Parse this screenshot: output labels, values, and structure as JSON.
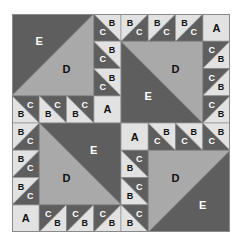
{
  "diagram": {
    "grid_units": 8,
    "colors": {
      "dark": "#5e5e5e",
      "medium": "#a9a9a9",
      "light": "#e2e2e2",
      "outline": "#8a8a8a",
      "label_on_dark": "#ffffff",
      "label_on_light": "#111111"
    },
    "piece_labels": {
      "A": "A",
      "B": "B",
      "C": "C",
      "D": "D",
      "E": "E"
    },
    "quadrants": [
      {
        "name": "top-left",
        "big_square": {
          "col": 0,
          "row": 0,
          "size": 3,
          "diagonal": "bl-tr",
          "dark_label": "E",
          "dark_side": "tl",
          "light_label": "D"
        },
        "square_a": {
          "col": 3,
          "row": 3,
          "label": "A"
        },
        "half_square_triangles": [
          {
            "col": 3,
            "row": 0,
            "diagonal": "tl-br",
            "dark_side": "bl"
          },
          {
            "col": 3,
            "row": 1,
            "diagonal": "tl-br",
            "dark_side": "bl"
          },
          {
            "col": 3,
            "row": 2,
            "diagonal": "tl-br",
            "dark_side": "bl"
          },
          {
            "col": 0,
            "row": 3,
            "diagonal": "tl-br",
            "dark_side": "tr"
          },
          {
            "col": 1,
            "row": 3,
            "diagonal": "tl-br",
            "dark_side": "tr"
          },
          {
            "col": 2,
            "row": 3,
            "diagonal": "tl-br",
            "dark_side": "tr"
          }
        ]
      },
      {
        "name": "top-right",
        "big_square": {
          "col": 4,
          "row": 1,
          "size": 3,
          "diagonal": "tl-br",
          "dark_label": "E",
          "dark_side": "bl",
          "light_label": "D"
        },
        "square_a": {
          "col": 7,
          "row": 0,
          "label": "A"
        },
        "half_square_triangles": [
          {
            "col": 4,
            "row": 0,
            "diagonal": "bl-tr",
            "dark_side": "br"
          },
          {
            "col": 5,
            "row": 0,
            "diagonal": "bl-tr",
            "dark_side": "br"
          },
          {
            "col": 6,
            "row": 0,
            "diagonal": "bl-tr",
            "dark_side": "br"
          },
          {
            "col": 7,
            "row": 1,
            "diagonal": "bl-tr",
            "dark_side": "tl"
          },
          {
            "col": 7,
            "row": 2,
            "diagonal": "bl-tr",
            "dark_side": "tl"
          },
          {
            "col": 7,
            "row": 3,
            "diagonal": "bl-tr",
            "dark_side": "tl"
          }
        ]
      },
      {
        "name": "bottom-left",
        "big_square": {
          "col": 1,
          "row": 4,
          "size": 3,
          "diagonal": "tl-br",
          "dark_label": "E",
          "dark_side": "tr",
          "light_label": "D"
        },
        "square_a": {
          "col": 0,
          "row": 7,
          "label": "A"
        },
        "half_square_triangles": [
          {
            "col": 0,
            "row": 4,
            "diagonal": "bl-tr",
            "dark_side": "br"
          },
          {
            "col": 0,
            "row": 5,
            "diagonal": "bl-tr",
            "dark_side": "br"
          },
          {
            "col": 0,
            "row": 6,
            "diagonal": "bl-tr",
            "dark_side": "br"
          },
          {
            "col": 1,
            "row": 7,
            "diagonal": "bl-tr",
            "dark_side": "tl"
          },
          {
            "col": 2,
            "row": 7,
            "diagonal": "bl-tr",
            "dark_side": "tl"
          },
          {
            "col": 3,
            "row": 7,
            "diagonal": "bl-tr",
            "dark_side": "tl"
          }
        ]
      },
      {
        "name": "bottom-right",
        "big_square": {
          "col": 5,
          "row": 5,
          "size": 3,
          "diagonal": "bl-tr",
          "dark_label": "E",
          "dark_side": "br",
          "light_label": "D"
        },
        "square_a": {
          "col": 4,
          "row": 4,
          "label": "A"
        },
        "half_square_triangles": [
          {
            "col": 5,
            "row": 4,
            "diagonal": "tl-br",
            "dark_side": "bl"
          },
          {
            "col": 6,
            "row": 4,
            "diagonal": "tl-br",
            "dark_side": "bl"
          },
          {
            "col": 7,
            "row": 4,
            "diagonal": "tl-br",
            "dark_side": "bl"
          },
          {
            "col": 4,
            "row": 5,
            "diagonal": "tl-br",
            "dark_side": "tr"
          },
          {
            "col": 4,
            "row": 6,
            "diagonal": "tl-br",
            "dark_side": "tr"
          },
          {
            "col": 4,
            "row": 7,
            "diagonal": "tl-br",
            "dark_side": "tr"
          }
        ]
      }
    ]
  }
}
